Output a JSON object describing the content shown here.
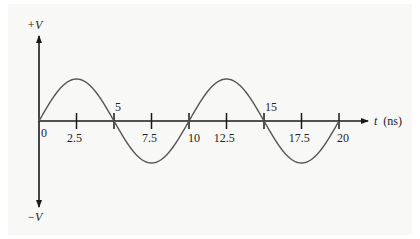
{
  "chart_data": {
    "type": "line",
    "title": "",
    "xlabel": "t (ns)",
    "xlabel_var": "t",
    "xlabel_unit": "(ns)",
    "ylabel_top": "+V",
    "ylabel_bottom": "−V",
    "x_ticks": [
      0,
      2.5,
      5,
      7.5,
      10,
      12.5,
      15,
      17.5,
      20
    ],
    "x_tick_labels": [
      "0",
      "2.5",
      "5",
      "7.5",
      "10",
      "12.5",
      "15",
      "17.5",
      "20"
    ],
    "xlim": [
      0,
      20
    ],
    "ylim": [
      -1,
      1
    ],
    "grid": false,
    "legend": null,
    "series": [
      {
        "name": "sine wave",
        "function": "0.5*V*sin(2*pi*t/10)",
        "period_ns": 10,
        "amplitude_fraction_of_V": 0.5,
        "x": [
          0,
          2.5,
          5,
          7.5,
          10,
          12.5,
          15,
          17.5,
          20
        ],
        "values": [
          0,
          0.5,
          0,
          -0.5,
          0,
          0.5,
          0,
          -0.5,
          0
        ]
      }
    ],
    "colors": {
      "axis": "#1a1a1a",
      "curve": "#555555"
    }
  }
}
